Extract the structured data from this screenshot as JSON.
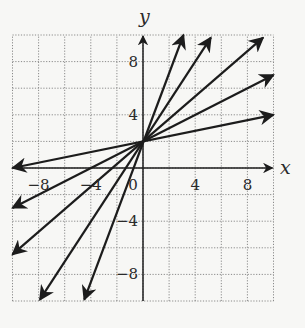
{
  "chart_data": {
    "type": "line",
    "title": "",
    "xlabel": "x",
    "ylabel": "y",
    "xlim": [
      -10,
      10
    ],
    "ylim": [
      -10,
      10
    ],
    "grid": true,
    "grid_step": 2,
    "x_ticks": [
      -8,
      -4,
      0,
      4,
      8
    ],
    "x_tick_labels": [
      "−8",
      "−4",
      "0",
      "4",
      "8"
    ],
    "y_ticks": [
      -8,
      -4,
      4,
      8
    ],
    "y_tick_labels": [
      "−8",
      "−4",
      "4",
      "8"
    ],
    "common_y_intercept": 2,
    "series": [
      {
        "name": "line-slope-0.2",
        "slope": 0.2,
        "intercept": 2,
        "x": [
          -10,
          10
        ],
        "y": [
          0,
          4
        ]
      },
      {
        "name": "line-slope-0.5",
        "slope": 0.5,
        "intercept": 2,
        "x": [
          -10,
          10
        ],
        "y": [
          -3,
          7
        ]
      },
      {
        "name": "line-slope-0.85",
        "slope": 0.85,
        "intercept": 2,
        "x": [
          -10,
          9.2
        ],
        "y": [
          -6.5,
          9.8
        ]
      },
      {
        "name": "line-slope-1.5",
        "slope": 1.5,
        "intercept": 2,
        "x": [
          -7.9,
          5.2
        ],
        "y": [
          -9.9,
          9.8
        ]
      },
      {
        "name": "line-slope-2.6",
        "slope": 2.6,
        "intercept": 2,
        "x": [
          -4.5,
          3.1
        ],
        "y": [
          -9.9,
          10
        ]
      }
    ],
    "legend": null
  }
}
